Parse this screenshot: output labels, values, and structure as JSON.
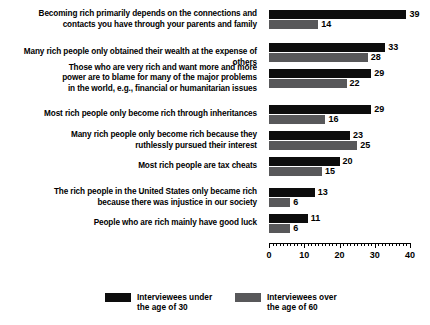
{
  "chart_data": {
    "type": "bar",
    "orientation": "horizontal",
    "title": "",
    "subtitle": "",
    "xlabel": "",
    "ylabel": "",
    "xlim": [
      0,
      40
    ],
    "xticks": [
      0,
      10,
      20,
      30,
      40
    ],
    "xtick_labels": [
      "0",
      "10",
      "20",
      "30",
      "40"
    ],
    "minor_tick_step": 1,
    "grid": false,
    "legend_position": "bottom",
    "categories": [
      "Becoming rich primarily depends on the connections and\ncontacts you have through your parents and family",
      "Many rich people only obtained their wealth at the expense of others",
      "Those who are very rich and want more and more\npower are to blame for many of the major problems\nin the world, e.g., financial or humanitarian issues",
      "Most rich people only become rich through inheritances",
      "Many rich people only become rich because they\nruthlessly pursued their interest",
      "Most rich people are tax cheats",
      "The rich people in the United States only became rich\nbecause there was injustice in our society",
      "People who are rich mainly have good luck"
    ],
    "series": [
      {
        "name": "Interviewees under\nthe age of 30",
        "color": "#0d0d0d",
        "values": [
          39,
          33,
          29,
          29,
          23,
          20,
          13,
          11
        ]
      },
      {
        "name": "Interviewees over\nthe age of 60",
        "color": "#58585a",
        "values": [
          14,
          28,
          22,
          16,
          25,
          15,
          6,
          6
        ]
      }
    ]
  },
  "legend": {
    "items": [
      {
        "label": "Interviewees under\nthe age of 30",
        "color": "#0d0d0d"
      },
      {
        "label": "Interviewees over\nthe age of 60",
        "color": "#58585a"
      }
    ]
  }
}
